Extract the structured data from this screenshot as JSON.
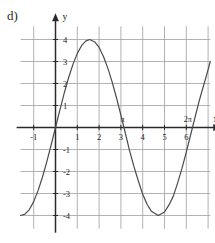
{
  "figure": {
    "part_label": "d)",
    "background_color": "#ffffff",
    "grid_color": "#a9a9a9",
    "axis_color": "#2a2a2a",
    "curve_color": "#4a4a4a",
    "text_color": "#1d1d1d"
  },
  "chart_data": {
    "type": "line",
    "title": "",
    "subtitle": "",
    "xlabel": "x",
    "ylabel": "y",
    "function": "y = 4 sin(x)",
    "amplitude": 4,
    "period": 6.283,
    "xlim": [
      -1.6,
      7.1
    ],
    "ylim": [
      -4.6,
      4.6
    ],
    "grid": true,
    "grid_x_step": 1,
    "grid_y_step": 1,
    "legend": "none",
    "x_tick_labels": [
      "-1",
      "1",
      "2",
      "3",
      "4",
      "5",
      "6"
    ],
    "x_tick_values": [
      -1,
      1,
      2,
      3,
      4,
      5,
      6
    ],
    "y_tick_labels": [
      "4",
      "3",
      "2",
      "1",
      "-1",
      "-2",
      "-3",
      "-4"
    ],
    "y_tick_values": [
      4,
      3,
      2,
      1,
      -1,
      -2,
      -3,
      -4
    ],
    "annotations": [
      {
        "text": "π",
        "x": 3,
        "y": 0,
        "position": "above-axis"
      },
      {
        "text": "2π",
        "x": 6,
        "y": 0,
        "position": "above-axis"
      }
    ],
    "x": [
      -1.6,
      -1.4,
      -1.2,
      -1.0,
      -0.8,
      -0.6,
      -0.4,
      -0.2,
      0.0,
      0.2,
      0.4,
      0.6,
      0.8,
      1.0,
      1.2,
      1.4,
      1.5708,
      1.8,
      2.0,
      2.2,
      2.4,
      2.6,
      2.8,
      3.0,
      3.1416,
      3.4,
      3.6,
      3.8,
      4.0,
      4.2,
      4.4,
      4.7124,
      5.0,
      5.2,
      5.4,
      5.6,
      5.8,
      6.0,
      6.2832,
      6.6,
      7.0,
      7.1
    ],
    "values": [
      -4.0,
      -3.94,
      -3.73,
      -3.37,
      -2.87,
      -2.26,
      -1.56,
      -0.79,
      0.0,
      0.79,
      1.56,
      2.26,
      2.87,
      3.37,
      3.73,
      3.94,
      4.0,
      3.89,
      3.64,
      3.23,
      2.7,
      2.06,
      1.34,
      0.56,
      0.0,
      -1.06,
      -1.78,
      -2.43,
      -3.03,
      -3.49,
      -3.81,
      -4.0,
      -3.84,
      -3.53,
      -3.13,
      -2.53,
      -1.86,
      -1.12,
      0.0,
      1.24,
      2.63,
      3.0
    ],
    "series": [
      {
        "name": "y = 4 sin(x)",
        "color": "#4a4a4a",
        "line_width": 1.2
      }
    ]
  },
  "axes": {
    "x_axis_label": "x",
    "y_axis_label": "y",
    "x_arrow": true,
    "y_arrow": true
  }
}
